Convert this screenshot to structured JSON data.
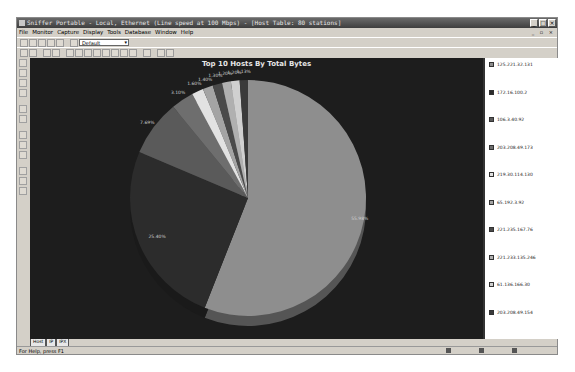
{
  "window": {
    "title": "Sniffer Portable - Local, Ethernet (Line speed at 100 Mbps) - [Host Table: 80 stations]",
    "buttons": [
      "minimize",
      "maximize",
      "close"
    ]
  },
  "menubar": {
    "items": [
      "File",
      "Monitor",
      "Capture",
      "Display",
      "Tools",
      "Database",
      "Window",
      "Help"
    ]
  },
  "toolbar": {
    "profile_select": "Default"
  },
  "chart_data": {
    "type": "pie",
    "title": "Top 10 Hosts By Total Bytes",
    "categories": [
      "125.221.32.131",
      "172.16.100.2",
      "106.3.40.92",
      "203.208.49.173",
      "219.30.114.130",
      "65.192.3.92",
      "221.235.167.76",
      "221.233.135.246",
      "61.136.166.30",
      "203.208.49.154"
    ],
    "values": [
      55.98,
      25.4,
      7.69,
      3.1,
      1.6,
      1.4,
      1.3,
      1.2,
      1.2,
      1.13
    ],
    "labels": [
      "55.98%",
      "25.40%",
      "7.69%",
      "3.10%",
      "1.60%",
      "1.40%",
      "1.30%",
      "1.20%",
      "1.20%",
      "1.13%"
    ],
    "colors": [
      "#8e8e8e",
      "#2c2c2c",
      "#5a5a5a",
      "#6e6e6e",
      "#e2e2e2",
      "#a4a4a4",
      "#4a4a4a",
      "#b0b0b0",
      "#d0d0d0",
      "#3a3a3a"
    ],
    "legend_position": "right"
  },
  "tabs": [
    "Host",
    "IP",
    "IPX"
  ],
  "statusbar": {
    "help_text": "For Help, press F1"
  }
}
